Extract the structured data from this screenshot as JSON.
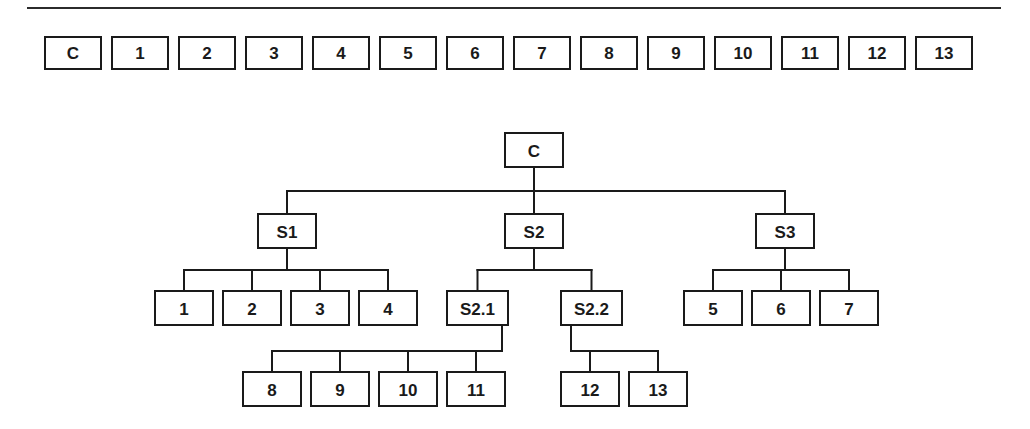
{
  "figure": {
    "top_rule": {
      "visible": true,
      "color": "#2b2b2b"
    },
    "line_color": "#1a1a1a",
    "box_fill": "#ffffff"
  },
  "flat_row": {
    "name": "flat-item-sequence",
    "items": [
      {
        "label": "C"
      },
      {
        "label": "1"
      },
      {
        "label": "2"
      },
      {
        "label": "3"
      },
      {
        "label": "4"
      },
      {
        "label": "5"
      },
      {
        "label": "6"
      },
      {
        "label": "7"
      },
      {
        "label": "8"
      },
      {
        "label": "9"
      },
      {
        "label": "10"
      },
      {
        "label": "11"
      },
      {
        "label": "12"
      },
      {
        "label": "13"
      }
    ]
  },
  "tree": {
    "root": "C",
    "nodes": [
      {
        "id": "C",
        "label": "C",
        "x": 505,
        "y": 133,
        "w": 58,
        "h": 34,
        "level": 0
      },
      {
        "id": "S1",
        "label": "S1",
        "x": 258,
        "y": 214,
        "w": 58,
        "h": 34,
        "level": 1
      },
      {
        "id": "S2",
        "label": "S2",
        "x": 505,
        "y": 214,
        "w": 58,
        "h": 34,
        "level": 1
      },
      {
        "id": "S3",
        "label": "S3",
        "x": 756,
        "y": 214,
        "w": 58,
        "h": 34,
        "level": 1
      },
      {
        "id": "n1",
        "label": "1",
        "x": 155,
        "y": 291,
        "w": 58,
        "h": 34,
        "level": 2
      },
      {
        "id": "n2",
        "label": "2",
        "x": 223,
        "y": 291,
        "w": 58,
        "h": 34,
        "level": 2
      },
      {
        "id": "n3",
        "label": "3",
        "x": 291,
        "y": 291,
        "w": 58,
        "h": 34,
        "level": 2
      },
      {
        "id": "n4",
        "label": "4",
        "x": 359,
        "y": 291,
        "w": 58,
        "h": 34,
        "level": 2
      },
      {
        "id": "S2.1",
        "label": "S2.1",
        "x": 447,
        "y": 291,
        "w": 61,
        "h": 34,
        "level": 2
      },
      {
        "id": "S2.2",
        "label": "S2.2",
        "x": 561,
        "y": 291,
        "w": 61,
        "h": 34,
        "level": 2
      },
      {
        "id": "n5",
        "label": "5",
        "x": 684,
        "y": 291,
        "w": 58,
        "h": 34,
        "level": 2
      },
      {
        "id": "n6",
        "label": "6",
        "x": 752,
        "y": 291,
        "w": 58,
        "h": 34,
        "level": 2
      },
      {
        "id": "n7",
        "label": "7",
        "x": 820,
        "y": 291,
        "w": 58,
        "h": 34,
        "level": 2
      },
      {
        "id": "n8",
        "label": "8",
        "x": 243,
        "y": 372,
        "w": 58,
        "h": 34,
        "level": 3
      },
      {
        "id": "n9",
        "label": "9",
        "x": 311,
        "y": 372,
        "w": 58,
        "h": 34,
        "level": 3
      },
      {
        "id": "n10",
        "label": "10",
        "x": 379,
        "y": 372,
        "w": 58,
        "h": 34,
        "level": 3
      },
      {
        "id": "n11",
        "label": "11",
        "x": 447,
        "y": 372,
        "w": 58,
        "h": 34,
        "level": 3
      },
      {
        "id": "n12",
        "label": "12",
        "x": 561,
        "y": 372,
        "w": 58,
        "h": 34,
        "level": 3
      },
      {
        "id": "n13",
        "label": "13",
        "x": 629,
        "y": 372,
        "w": 58,
        "h": 34,
        "level": 3
      }
    ],
    "groups": [
      {
        "name": "root-to-subsystems",
        "parent": "C",
        "children": [
          "S1",
          "S2",
          "S3"
        ],
        "bus_y": 191,
        "drop_from": "center"
      },
      {
        "name": "s1-children",
        "parent": "S1",
        "children": [
          "n1",
          "n2",
          "n3",
          "n4"
        ],
        "bus_y": 270,
        "drop_from": "center"
      },
      {
        "name": "s2-children",
        "parent": "S2",
        "children": [
          "S2.1",
          "S2.2"
        ],
        "bus_y": 270,
        "drop_from": "center"
      },
      {
        "name": "s3-children",
        "parent": "S3",
        "children": [
          "n5",
          "n6",
          "n7"
        ],
        "bus_y": 270,
        "drop_from": "center"
      },
      {
        "name": "s2-1-children",
        "parent": "S2.1",
        "children": [
          "n8",
          "n9",
          "n10",
          "n11"
        ],
        "bus_y": 351,
        "drop_from": "right"
      },
      {
        "name": "s2-2-children",
        "parent": "S2.2",
        "children": [
          "n12",
          "n13"
        ],
        "bus_y": 351,
        "drop_from": "left-inset"
      }
    ]
  }
}
